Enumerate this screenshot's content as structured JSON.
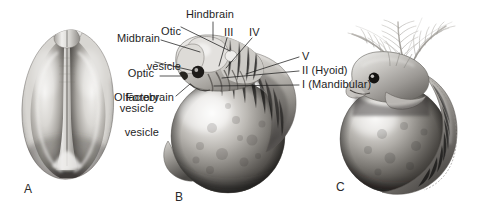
{
  "figure": {
    "background": "#ffffff",
    "text_color": "#1e1e1e",
    "width": 489,
    "height": 208,
    "type": "scientific-illustration"
  },
  "panels": [
    {
      "letter": "A",
      "caption": "",
      "view": "dorsal view of neurula-stage embryo"
    },
    {
      "letter": "B",
      "caption": "",
      "view": "lateral view of embryo on yolk sac with brain vesicles and pharyngeal arches"
    },
    {
      "letter": "C",
      "caption": "",
      "view": "later-stage embryo with external gill filaments and tail"
    }
  ],
  "labels": {
    "otic_vesicle": {
      "line1": "Otic",
      "line2": "vesicle"
    },
    "hindbrain": "Hindbrain",
    "midbrain": "Midbrain",
    "optic_vesicle": {
      "line1": "Optic",
      "line2": "vesicle"
    },
    "olfactory_vesicle": {
      "line1": "Olfactory",
      "line2": "vesicle"
    },
    "forebrain": "Forebrain",
    "arch_iii": "III",
    "arch_iv": "IV",
    "arch_v": "V",
    "arch_ii": "II (Hyoid)",
    "arch_i": "I (Mandibular)"
  },
  "structures": {
    "yolk_sac": "yolk sac",
    "neural_groove": "neural groove",
    "external_gills": "external gill filaments",
    "eye": "pigmented eye",
    "tail": "tail"
  }
}
